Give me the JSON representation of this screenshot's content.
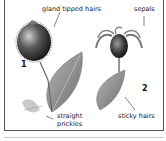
{
  "figure": {
    "panels": [
      {
        "number": "1",
        "labels": {
          "top": "gland tipped hairs",
          "bottom_line1": "straight",
          "bottom_line2": "prickles"
        }
      },
      {
        "number": "2",
        "labels": {
          "top": "sepals",
          "bottom": "sticky hairs"
        }
      }
    ],
    "colors": {
      "line": "#333333",
      "fruit_dark": "#2a2a2a",
      "leaf": "#8a8a8a",
      "border": "#555555"
    }
  }
}
